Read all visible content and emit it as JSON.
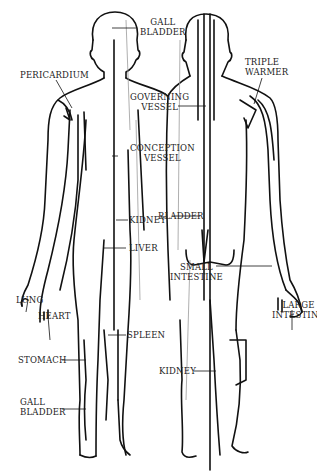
{
  "diagram": {
    "labels": {
      "gall_bladder_top": [
        "GALL",
        "BLADDER"
      ],
      "pericardium": "PERICARDIUM",
      "triple_warmer": [
        "TRIPLE",
        "WARMER"
      ],
      "governing_vessel": [
        "GOVERNING",
        "VESSEL"
      ],
      "conception_vessel": [
        "CONCEPTION",
        "VESSEL"
      ],
      "bladder": "BLADDER",
      "kidney_front": "KIDNEY",
      "liver": "LIVER",
      "small_intestine": [
        "SMALL",
        "INTESTINE"
      ],
      "lung": "LUNG",
      "heart": "HEART",
      "large_intestine": [
        "LARGE",
        "INTESTINE"
      ],
      "spleen": "SPLEEN",
      "stomach": "STOMACH",
      "kidney_back": "KIDNEY",
      "gall_bladder_bottom": [
        "GALL",
        "BLADDER"
      ]
    },
    "colors": {
      "line": "#111111",
      "faint": "#9a9a9a",
      "background": "#ffffff"
    }
  }
}
